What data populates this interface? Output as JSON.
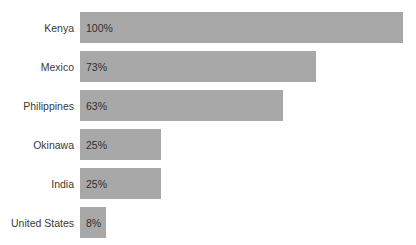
{
  "chart_data": {
    "type": "bar",
    "orientation": "horizontal",
    "title": "",
    "xlabel": "",
    "ylabel": "",
    "xlim": [
      0,
      100
    ],
    "grid": false,
    "legend": false,
    "categories": [
      "Kenya",
      "Mexico",
      "Philippines",
      "Okinawa",
      "India",
      "United States"
    ],
    "values": [
      100,
      73,
      63,
      25,
      25,
      8
    ],
    "value_labels": [
      "100%",
      "73%",
      "63%",
      "25%",
      "25%",
      "8%"
    ],
    "bars": [
      {
        "category": "Kenya",
        "value": 100,
        "label": "100%"
      },
      {
        "category": "Mexico",
        "value": 73,
        "label": "73%"
      },
      {
        "category": "Philippines",
        "value": 63,
        "label": "63%"
      },
      {
        "category": "Okinawa",
        "value": 25,
        "label": "25%"
      },
      {
        "category": "India",
        "value": 25,
        "label": "25%"
      },
      {
        "category": "United States",
        "value": 8,
        "label": "8%"
      }
    ],
    "colors": {
      "bar": "#a8a8a8",
      "background": "#ffffff",
      "category_text": "#3a3a3a",
      "value_text": "#2f2f2f"
    }
  },
  "artifact": {
    "top_right_clipped_text": ""
  }
}
